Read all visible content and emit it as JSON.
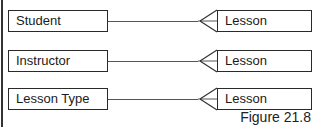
{
  "diagram": {
    "relationships": [
      {
        "from": "Student",
        "to": "Lesson",
        "cardinality": "one-to-many"
      },
      {
        "from": "Instructor",
        "to": "Lesson",
        "cardinality": "one-to-many"
      },
      {
        "from": "Lesson Type",
        "to": "Lesson",
        "cardinality": "one-to-many"
      }
    ],
    "caption": "Figure 21.8"
  },
  "colors": {
    "line": "#555555",
    "border": "#2a2a2a",
    "text": "#1a1a1a"
  }
}
